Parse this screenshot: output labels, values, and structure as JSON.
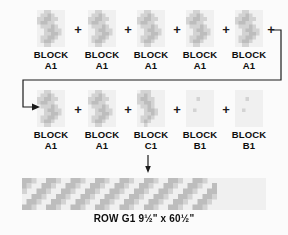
{
  "diagram": {
    "type": "quilt-row-assembly",
    "separator_symbol": "+",
    "rows": [
      {
        "id": "row-1",
        "blocks": [
          {
            "label_line1": "BLOCK",
            "label_line2": "A1",
            "pattern": "A1"
          },
          {
            "label_line1": "BLOCK",
            "label_line2": "A1",
            "pattern": "A1"
          },
          {
            "label_line1": "BLOCK",
            "label_line2": "A1",
            "pattern": "A1"
          },
          {
            "label_line1": "BLOCK",
            "label_line2": "A1",
            "pattern": "A1"
          },
          {
            "label_line1": "BLOCK",
            "label_line2": "A1",
            "pattern": "A1"
          }
        ]
      },
      {
        "id": "row-2",
        "blocks": [
          {
            "label_line1": "BLOCK",
            "label_line2": "A1",
            "pattern": "A1"
          },
          {
            "label_line1": "BLOCK",
            "label_line2": "A1",
            "pattern": "A1"
          },
          {
            "label_line1": "BLOCK",
            "label_line2": "C1",
            "pattern": "C1"
          },
          {
            "label_line1": "BLOCK",
            "label_line2": "B1",
            "pattern": "B1"
          },
          {
            "label_line1": "BLOCK",
            "label_line2": "B1",
            "pattern": "B1"
          }
        ]
      }
    ],
    "wrap_connector": {
      "name": "continuation-arrow",
      "description": "line from end of row 1 wrapping down and left into start of row 2",
      "arrowhead": "right"
    },
    "result_arrow": {
      "name": "down-arrow",
      "direction": "down"
    },
    "assembled_row": {
      "name": "assembled-row-strip",
      "pattern": "ROW G1"
    },
    "caption": "ROW G1 9½\" x 60½\"",
    "colors": {
      "background": "#fbfbfb",
      "ink": "#0d0d0d",
      "block_light": "#f0f0f0",
      "block_mid": "#d3d3d3",
      "block_dark": "#bdbdbd"
    }
  }
}
